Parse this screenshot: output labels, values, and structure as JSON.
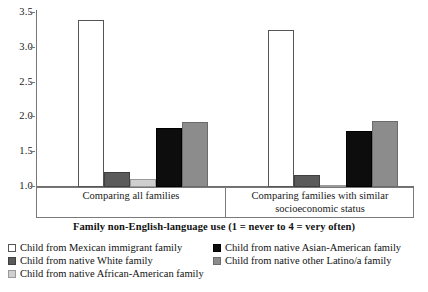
{
  "chart_data": {
    "type": "bar",
    "title": "",
    "xlabel": "Family non-English-language use (1 = never to 4 = very often)",
    "ylabel": "",
    "ylim": [
      1.0,
      3.5
    ],
    "yticks": [
      "3.5",
      "3.0",
      "2.5",
      "2.0",
      "1.5",
      "1.0"
    ],
    "ytick_values": [
      3.5,
      3.0,
      2.5,
      2.0,
      1.5,
      1.0
    ],
    "grid": false,
    "legend_position": "bottom",
    "categories": [
      "Comparing all families",
      "Comparing families with similar socioeconomic status"
    ],
    "category_lines": [
      [
        "Comparing all families"
      ],
      [
        "Comparing families with similar",
        "socioeconomic status"
      ]
    ],
    "series": [
      {
        "name": "Child from Mexican immigrant family",
        "values": [
          3.4,
          3.25
        ],
        "color": "#ffffff",
        "edge": "#555555",
        "swatch": "sw-white"
      },
      {
        "name": "Child from native White family",
        "values": [
          1.21,
          1.17
        ],
        "color": "#5a5a5a",
        "edge": "#3f3f3f",
        "swatch": "sw-dark"
      },
      {
        "name": "Child from native African-American family",
        "values": [
          1.11,
          1.03
        ],
        "color": "#cfcfcf",
        "edge": "#9a9a9a",
        "swatch": "sw-light"
      },
      {
        "name": "Child from native Asian-American family",
        "values": [
          1.85,
          1.8
        ],
        "color": "#0d0d0d",
        "edge": "#000000",
        "swatch": "sw-black"
      },
      {
        "name": "Child from native other Latino/a family",
        "values": [
          1.93,
          1.95
        ],
        "color": "#8c8c8c",
        "edge": "#6b6b6b",
        "swatch": "sw-mid"
      }
    ]
  },
  "legend": {
    "items": [
      {
        "label": "Child from Mexican immigrant family",
        "swatch": "sw-white",
        "col": 0,
        "row": 0
      },
      {
        "label": "Child from native White family",
        "swatch": "sw-dark",
        "col": 0,
        "row": 1
      },
      {
        "label": "Child from native African-American family",
        "swatch": "sw-light",
        "col": 0,
        "row": 2
      },
      {
        "label": "Child from native Asian-American family",
        "swatch": "sw-black",
        "col": 1,
        "row": 0
      },
      {
        "label": "Child from native other Latino/a family",
        "swatch": "sw-mid",
        "col": 1,
        "row": 1
      }
    ]
  }
}
